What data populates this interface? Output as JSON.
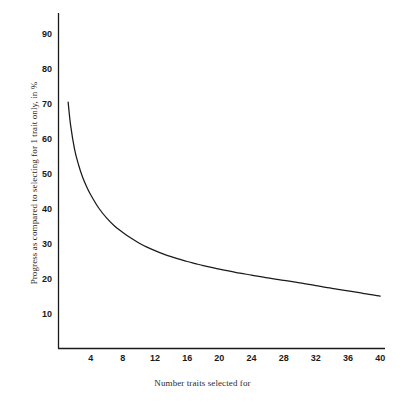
{
  "chart_data": {
    "type": "line",
    "title": "",
    "xlabel": "Number traits selected for",
    "ylabel": "Progress as compared to selecting for 1 trait only, in %",
    "xlim": [
      0,
      40.6
    ],
    "ylim": [
      0,
      96
    ],
    "grid": false,
    "legend": null,
    "xticks": [
      4,
      8,
      12,
      16,
      20,
      24,
      28,
      32,
      36,
      40
    ],
    "xtick_labels": [
      "4",
      "8",
      "12",
      "16",
      "20",
      "24",
      "28",
      "32",
      "36",
      "40"
    ],
    "yticks": [
      10,
      20,
      30,
      40,
      50,
      60,
      70,
      80,
      90
    ],
    "ytick_labels": [
      "10",
      "20",
      "30",
      "40",
      "50",
      "60",
      "70",
      "80",
      "90"
    ],
    "series": [
      {
        "name": "Progress",
        "color": "#1a1a1a",
        "x": [
          1.2,
          1.5,
          2,
          2.5,
          3,
          3.5,
          4,
          5,
          6,
          7,
          8,
          9,
          10,
          11,
          12,
          13,
          14,
          15,
          16,
          17,
          18,
          19,
          20,
          22,
          24,
          26,
          28,
          30,
          32,
          34,
          36,
          38,
          40
        ],
        "y": [
          70.5,
          64.0,
          57.0,
          52.5,
          49.0,
          46.3,
          44.0,
          40.2,
          37.3,
          35.0,
          33.2,
          31.6,
          30.2,
          29.0,
          28.0,
          27.1,
          26.3,
          25.6,
          24.9,
          24.3,
          23.7,
          23.2,
          22.7,
          21.8,
          21.0,
          20.2,
          19.5,
          18.8,
          18.0,
          17.2,
          16.5,
          15.7,
          15.0
        ]
      }
    ]
  },
  "axes": {
    "x_title": "Number traits selected for",
    "y_title": "Progress as compared to selecting for 1 trait only, in %"
  },
  "colors": {
    "curve": "#1a1a1a",
    "axis": "#1a1a1a",
    "background": "#ffffff",
    "tick_text": "#1a1a1a",
    "title_text": "#2b2b2b"
  }
}
